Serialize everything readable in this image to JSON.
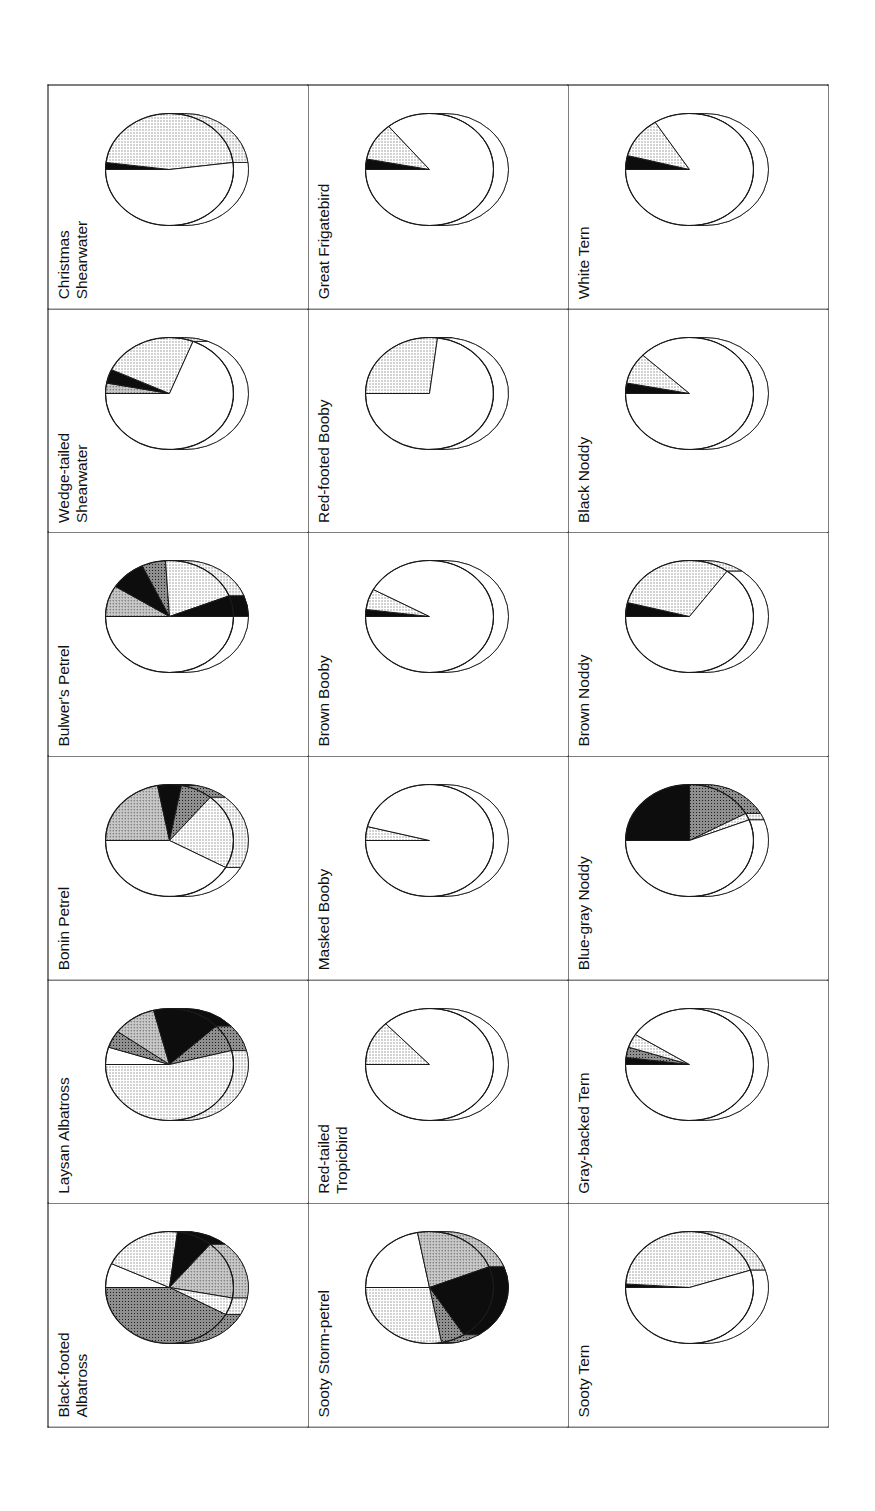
{
  "figure": {
    "type": "pie-chart-grid",
    "orientation": "rotated-90-counterclockwise",
    "rows": 3,
    "columns": 6,
    "border_color": "#000000",
    "background_color": "#ffffff"
  },
  "legend_tones": {
    "white": "#ffffff",
    "light_stipple": "#dcdcdc",
    "medium_stipple": "#b4b4b4",
    "dark_stipple": "#6e6e6e",
    "black": "#0d0d0d"
  },
  "chart_data": [
    {
      "type": "pie",
      "title": "Black-footed Albatross",
      "categories": [
        "White",
        "Light stipple",
        "Black",
        "Medium stipple",
        "Light stipple 2",
        "Dark stipple"
      ],
      "values": [
        7,
        20,
        9,
        17,
        5,
        42
      ],
      "start_angle": 0,
      "slices": [
        {
          "tone": "white",
          "value": 7
        },
        {
          "tone": "light",
          "value": 20
        },
        {
          "tone": "black",
          "value": 9
        },
        {
          "tone": "medium",
          "value": 17
        },
        {
          "tone": "light",
          "value": 5
        },
        {
          "tone": "dark",
          "value": 42
        }
      ]
    },
    {
      "type": "pie",
      "title": "Laysan Albatross",
      "categories": [
        "White",
        "Dark stipple",
        "Medium stipple",
        "Black",
        "Dark stipple 2",
        "Light stipple"
      ],
      "values": [
        5,
        5,
        11,
        17,
        8,
        54
      ],
      "start_angle": 0,
      "slices": [
        {
          "tone": "white",
          "value": 5
        },
        {
          "tone": "dark",
          "value": 5
        },
        {
          "tone": "medium",
          "value": 11
        },
        {
          "tone": "black",
          "value": 17
        },
        {
          "tone": "dark",
          "value": 8
        },
        {
          "tone": "light",
          "value": 54
        }
      ]
    },
    {
      "type": "pie",
      "title": "Bonin Petrel",
      "categories": [
        "Medium stipple",
        "Black",
        "Dark stipple",
        "Light stipple",
        "White"
      ],
      "values": [
        22,
        6,
        8,
        22,
        42
      ],
      "start_angle": 0,
      "slices": [
        {
          "tone": "medium",
          "value": 22
        },
        {
          "tone": "black",
          "value": 6
        },
        {
          "tone": "dark",
          "value": 8
        },
        {
          "tone": "light",
          "value": 22
        },
        {
          "tone": "white",
          "value": 42
        }
      ]
    },
    {
      "type": "pie",
      "title": "Bulwer's Petrel",
      "categories": [
        "Medium stipple",
        "Black",
        "Dark stipple",
        "Light stipple",
        "Black 2",
        "White"
      ],
      "values": [
        9,
        9,
        6,
        20,
        6,
        50
      ],
      "start_angle": 0,
      "slices": [
        {
          "tone": "medium",
          "value": 9
        },
        {
          "tone": "black",
          "value": 9
        },
        {
          "tone": "dark",
          "value": 6
        },
        {
          "tone": "light",
          "value": 20
        },
        {
          "tone": "black",
          "value": 6
        },
        {
          "tone": "white",
          "value": 50
        }
      ]
    },
    {
      "type": "pie",
      "title": "Wedge-tailed Shearwater",
      "categories": [
        "Medium stipple",
        "Black",
        "Light stipple",
        "White"
      ],
      "values": [
        3,
        4,
        24,
        69
      ],
      "start_angle": 0,
      "slices": [
        {
          "tone": "medium",
          "value": 3
        },
        {
          "tone": "black",
          "value": 4
        },
        {
          "tone": "light",
          "value": 24
        },
        {
          "tone": "white",
          "value": 69
        }
      ]
    },
    {
      "type": "pie",
      "title": "Christmas Shearwater",
      "categories": [
        "Black",
        "Light stipple",
        "White"
      ],
      "values": [
        2,
        46,
        52
      ],
      "start_angle": 0,
      "slices": [
        {
          "tone": "black",
          "value": 2
        },
        {
          "tone": "light",
          "value": 46
        },
        {
          "tone": "white",
          "value": 52
        }
      ]
    },
    {
      "type": "pie",
      "title": "Sooty Storm-petrel",
      "categories": [
        "White",
        "Medium stipple",
        "Black",
        "Dark stipple",
        "Light stipple"
      ],
      "values": [
        22,
        22,
        22,
        6,
        28
      ],
      "start_angle": 0,
      "slices": [
        {
          "tone": "white",
          "value": 22
        },
        {
          "tone": "medium",
          "value": 22
        },
        {
          "tone": "black",
          "value": 22
        },
        {
          "tone": "dark",
          "value": 6
        },
        {
          "tone": "light",
          "value": 28
        }
      ]
    },
    {
      "type": "pie",
      "title": "Red-tailed Tropicbird",
      "categories": [
        "Light stipple",
        "White"
      ],
      "values": [
        13,
        87
      ],
      "start_angle": 0,
      "slices": [
        {
          "tone": "light",
          "value": 13
        },
        {
          "tone": "white",
          "value": 87
        }
      ]
    },
    {
      "type": "pie",
      "title": "Masked Booby",
      "categories": [
        "Light stipple",
        "White"
      ],
      "values": [
        4,
        96
      ],
      "start_angle": 0,
      "slices": [
        {
          "tone": "light",
          "value": 4
        },
        {
          "tone": "white",
          "value": 96
        }
      ]
    },
    {
      "type": "pie",
      "title": "Brown Booby",
      "categories": [
        "Black",
        "Light stipple",
        "White"
      ],
      "values": [
        2,
        6,
        92
      ],
      "start_angle": 0,
      "slices": [
        {
          "tone": "black",
          "value": 2
        },
        {
          "tone": "light",
          "value": 6
        },
        {
          "tone": "white",
          "value": 92
        }
      ]
    },
    {
      "type": "pie",
      "title": "Red-footed Booby",
      "categories": [
        "Light stipple",
        "White"
      ],
      "values": [
        27,
        73
      ],
      "start_angle": 0,
      "slices": [
        {
          "tone": "light",
          "value": 27
        },
        {
          "tone": "white",
          "value": 73
        }
      ]
    },
    {
      "type": "pie",
      "title": "Great Frigatebird",
      "categories": [
        "Black",
        "Light stipple",
        "White"
      ],
      "values": [
        3,
        11,
        86
      ],
      "start_angle": 0,
      "slices": [
        {
          "tone": "black",
          "value": 3
        },
        {
          "tone": "light",
          "value": 11
        },
        {
          "tone": "white",
          "value": 86
        }
      ]
    },
    {
      "type": "pie",
      "title": "Sooty Tern",
      "categories": [
        "Black",
        "Light stipple",
        "White"
      ],
      "values": [
        1,
        44,
        55
      ],
      "start_angle": 0,
      "slices": [
        {
          "tone": "black",
          "value": 1
        },
        {
          "tone": "light",
          "value": 44
        },
        {
          "tone": "white",
          "value": 55
        }
      ]
    },
    {
      "type": "pie",
      "title": "Gray-backed Tern",
      "categories": [
        "Black",
        "Dark stipple",
        "Light stipple",
        "White"
      ],
      "values": [
        2,
        3,
        4,
        91
      ],
      "start_angle": 0,
      "slices": [
        {
          "tone": "black",
          "value": 2
        },
        {
          "tone": "dark",
          "value": 3
        },
        {
          "tone": "light",
          "value": 4
        },
        {
          "tone": "white",
          "value": 91
        }
      ]
    },
    {
      "type": "pie",
      "title": "Blue-gray Noddy",
      "categories": [
        "Black",
        "Dark stipple",
        "Light stipple",
        "White"
      ],
      "values": [
        25,
        17,
        2,
        56
      ],
      "start_angle": 0,
      "slices": [
        {
          "tone": "black",
          "value": 25
        },
        {
          "tone": "dark",
          "value": 17
        },
        {
          "tone": "light",
          "value": 2
        },
        {
          "tone": "white",
          "value": 56
        }
      ]
    },
    {
      "type": "pie",
      "title": "Brown Noddy",
      "categories": [
        "Black",
        "Light stipple",
        "White"
      ],
      "values": [
        4,
        31,
        65
      ],
      "start_angle": 0,
      "slices": [
        {
          "tone": "black",
          "value": 4
        },
        {
          "tone": "light",
          "value": 31
        },
        {
          "tone": "white",
          "value": 65
        }
      ]
    },
    {
      "type": "pie",
      "title": "Black Noddy",
      "categories": [
        "Black",
        "Light stipple",
        "White"
      ],
      "values": [
        3,
        9,
        88
      ],
      "start_angle": 0,
      "slices": [
        {
          "tone": "black",
          "value": 3
        },
        {
          "tone": "light",
          "value": 9
        },
        {
          "tone": "white",
          "value": 88
        }
      ]
    },
    {
      "type": "pie",
      "title": "White Tern",
      "categories": [
        "Black",
        "Light stipple",
        "White"
      ],
      "values": [
        4,
        12,
        84
      ],
      "start_angle": 0,
      "slices": [
        {
          "tone": "black",
          "value": 4
        },
        {
          "tone": "light",
          "value": 12
        },
        {
          "tone": "white",
          "value": 84
        }
      ]
    }
  ],
  "grid": {
    "row1": [
      "Black-footed\nAlbatross",
      "Laysan Albatross",
      "Bonin Petrel",
      "Bulwer's Petrel",
      "Wedge-tailed\nShearwater",
      "Christmas\nShearwater"
    ],
    "row2": [
      "Sooty Storm-petrel",
      "Red-tailed\nTropicbird",
      "Masked Booby",
      "Brown Booby",
      "Red-footed Booby",
      "Great Frigatebird"
    ],
    "row3": [
      "Sooty Tern",
      "Gray-backed Tern",
      "Blue-gray Noddy",
      "Brown Noddy",
      "Black Noddy",
      "White Tern"
    ]
  }
}
